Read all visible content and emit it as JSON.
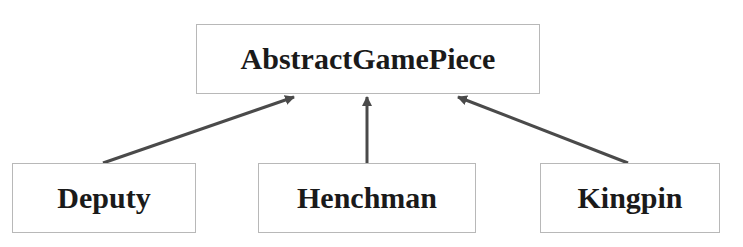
{
  "diagram": {
    "type": "class-inheritance",
    "root": {
      "label": "AbstractGamePiece"
    },
    "children": [
      {
        "label": "Deputy"
      },
      {
        "label": "Henchman"
      },
      {
        "label": "Kingpin"
      }
    ],
    "edges": [
      {
        "from": "Deputy",
        "to": "AbstractGamePiece",
        "style": "arrow"
      },
      {
        "from": "Henchman",
        "to": "AbstractGamePiece",
        "style": "arrow"
      },
      {
        "from": "Kingpin",
        "to": "AbstractGamePiece",
        "style": "arrow"
      }
    ],
    "colors": {
      "edge": "#4a4a4a",
      "border": "#b8b8b8",
      "text": "#1a1a1a"
    }
  }
}
